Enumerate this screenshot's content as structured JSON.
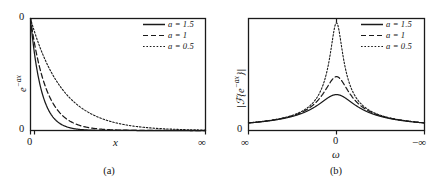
{
  "figure": {
    "panels": [
      {
        "id": "a",
        "caption": "(a)",
        "ylabel": "e−ax",
        "ylabel_plain": "e^{-ax}",
        "xlabel": "x",
        "y_ticks": [
          "0",
          "0"
        ],
        "y_tick_top": "0",
        "y_tick_bottom": "0",
        "x_tick_left": "0",
        "x_tick_right": "∞",
        "legend": [
          {
            "label": "a = 1.5",
            "a": 1.5,
            "style": "solid"
          },
          {
            "label": "a = 1",
            "a": 1,
            "style": "dashed"
          },
          {
            "label": "a = 0.5",
            "a": 0.5,
            "style": "dotted"
          }
        ]
      },
      {
        "id": "b",
        "caption": "(b)",
        "ylabel": "|ℱ{e−ax}|",
        "ylabel_plain": "|F{e^{-ax}}|",
        "xlabel": "ω",
        "y_tick_bottom": "0",
        "x_tick_left": "∞",
        "x_tick_center": "0",
        "x_tick_right": "−∞",
        "legend": [
          {
            "label": "a = 1.5",
            "a": 1.5,
            "style": "solid"
          },
          {
            "label": "a = 1",
            "a": 1,
            "style": "dashed"
          },
          {
            "label": "a = 0.5",
            "a": 0.5,
            "style": "dotted"
          }
        ]
      }
    ]
  },
  "chart_data": [
    {
      "type": "line",
      "panel": "a",
      "title": "",
      "xlabel": "x",
      "ylabel": "e^{-ax}",
      "xlim": [
        0,
        10
      ],
      "ylim": [
        0,
        1
      ],
      "xtick_labels": [
        "0",
        "∞"
      ],
      "ytick_labels": [
        "0",
        "0"
      ],
      "grid": false,
      "legend_position": "top-right",
      "x": [
        0,
        0.25,
        0.5,
        0.75,
        1,
        1.5,
        2,
        2.5,
        3,
        3.5,
        4,
        5,
        6,
        7,
        8,
        9,
        10
      ],
      "series": [
        {
          "name": "a = 1.5",
          "style": "solid",
          "values": [
            1,
            0.687,
            0.472,
            0.325,
            0.223,
            0.105,
            0.05,
            0.024,
            0.011,
            0.005,
            0.002,
            0.001,
            0,
            0,
            0,
            0,
            0
          ]
        },
        {
          "name": "a = 1",
          "style": "dashed",
          "values": [
            1,
            0.779,
            0.607,
            0.472,
            0.368,
            0.223,
            0.135,
            0.082,
            0.05,
            0.03,
            0.018,
            0.007,
            0.002,
            0.001,
            0,
            0,
            0
          ]
        },
        {
          "name": "a = 0.5",
          "style": "dotted",
          "values": [
            1,
            0.882,
            0.779,
            0.687,
            0.607,
            0.472,
            0.368,
            0.287,
            0.223,
            0.174,
            0.135,
            0.082,
            0.05,
            0.03,
            0.018,
            0.011,
            0.007
          ]
        }
      ]
    },
    {
      "type": "line",
      "panel": "b",
      "title": "",
      "xlabel": "ω",
      "ylabel": "|F{e^{-ax}}|",
      "xlim": [
        -6,
        6
      ],
      "ylim": [
        0,
        2
      ],
      "xtick_labels": [
        "∞",
        "0",
        "−∞"
      ],
      "ytick_labels": [
        "0"
      ],
      "grid": false,
      "legend_position": "top-right",
      "note": "Lorentzian magnitude 1/sqrt(a^2+w^2); x axis runs +inf (left) through 0 (center) to -inf (right)",
      "x": [
        -6,
        -5,
        -4,
        -3,
        -2.5,
        -2,
        -1.5,
        -1,
        -0.75,
        -0.5,
        -0.25,
        0,
        0.25,
        0.5,
        0.75,
        1,
        1.5,
        2,
        2.5,
        3,
        4,
        5,
        6
      ],
      "series": [
        {
          "name": "a = 1.5",
          "style": "solid",
          "values": [
            0.162,
            0.192,
            0.234,
            0.298,
            0.343,
            0.4,
            0.471,
            0.555,
            0.596,
            0.632,
            0.657,
            0.667,
            0.657,
            0.632,
            0.596,
            0.555,
            0.471,
            0.4,
            0.343,
            0.298,
            0.234,
            0.192,
            0.162
          ]
        },
        {
          "name": "a = 1",
          "style": "dashed",
          "values": [
            0.164,
            0.196,
            0.243,
            0.316,
            0.371,
            0.447,
            0.555,
            0.707,
            0.8,
            0.894,
            0.97,
            1.0,
            0.97,
            0.894,
            0.8,
            0.707,
            0.555,
            0.447,
            0.371,
            0.316,
            0.243,
            0.196,
            0.164
          ]
        },
        {
          "name": "a = 0.5",
          "style": "dotted",
          "values": [
            0.166,
            0.199,
            0.248,
            0.329,
            0.392,
            0.485,
            0.632,
            0.894,
            1.109,
            1.414,
            1.789,
            2.0,
            1.789,
            1.414,
            1.109,
            0.894,
            0.632,
            0.485,
            0.392,
            0.329,
            0.248,
            0.199,
            0.166
          ]
        }
      ]
    }
  ]
}
